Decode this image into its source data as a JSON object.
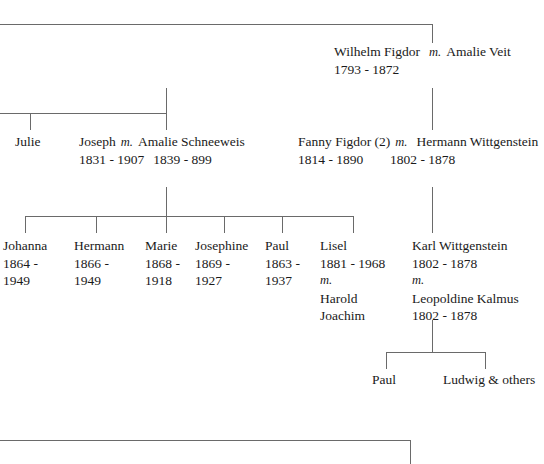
{
  "diagram": {
    "line_color": "#6a6a6a"
  },
  "generations": {
    "g1": {
      "wilhelm": {
        "name": "Wilhelm  Figdor",
        "marriage_mark": "m.",
        "spouse": "Amalie Veit",
        "dates": "1793 - 1872"
      }
    },
    "g2": {
      "julie": {
        "name": "Julie"
      },
      "joseph": {
        "name": "Joseph",
        "marriage_mark": "m.",
        "spouse": "Amalie Schneeweis",
        "dates_self": "1831 - 1907",
        "dates_spouse": "1839 - 899"
      },
      "fanny": {
        "name": "Fanny Figdor (2)",
        "marriage_mark": "m.",
        "spouse": "Hermann Wittgenstein",
        "dates_self": "1814 - 1890",
        "dates_spouse": "1802 - 1878"
      }
    },
    "g3": {
      "children": [
        {
          "name": "Johanna",
          "born": "1864 -",
          "died": "1949"
        },
        {
          "name": "Hermann",
          "born": "1866 -",
          "died": "1949"
        },
        {
          "name": "Marie",
          "born": "1868 -",
          "died": "1918"
        },
        {
          "name": "Josephine",
          "born": "1869 -",
          "died": "1927"
        },
        {
          "name": "Paul",
          "born": "1863 -",
          "died": "1937"
        }
      ],
      "lisel": {
        "name": "Lisel",
        "dates": "1881 - 1968",
        "marriage_mark": "m.",
        "spouse_first": "Harold",
        "spouse_last": "Joachim"
      },
      "karl": {
        "name": "Karl Wittgenstein",
        "dates": "1802 - 1878",
        "marriage_mark": "m.",
        "spouse": "Leopoldine Kalmus",
        "spouse_dates": "1802 - 1878"
      }
    },
    "g4": {
      "paul": {
        "name": "Paul"
      },
      "ludwig": {
        "name": "Ludwig & others"
      }
    }
  }
}
